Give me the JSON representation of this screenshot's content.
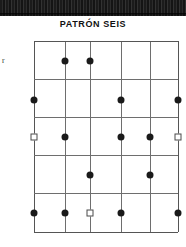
{
  "page": {
    "title": "PATRÓN SEIS",
    "margin_char": "r",
    "scan_band_color": "#1a1a1a",
    "background_color": "#ffffff"
  },
  "chart_data": {
    "type": "scatter",
    "title": "PATRÓN SEIS",
    "xlabel": "",
    "ylabel": "",
    "grid": true,
    "legend": "none",
    "x_gridlines": [
      0,
      1,
      2,
      3,
      4,
      5
    ],
    "y_gridlines": [
      0,
      1,
      2,
      3,
      4,
      5
    ],
    "column_positions_px": [
      34,
      65,
      90,
      121,
      150,
      178
    ],
    "row_positions_px": [
      41,
      79,
      117,
      155,
      193,
      232
    ],
    "marker_styles": {
      "dot": "filled-circle-black",
      "square": "open-square-outline"
    },
    "points": [
      {
        "row": 1,
        "col": 1,
        "marker": "dot",
        "x_px": 65,
        "y_px": 61
      },
      {
        "row": 1,
        "col": 2,
        "marker": "dot",
        "x_px": 90,
        "y_px": 61
      },
      {
        "row": 2,
        "col": 0,
        "marker": "dot",
        "x_px": 34,
        "y_px": 100
      },
      {
        "row": 2,
        "col": 3,
        "marker": "dot",
        "x_px": 121,
        "y_px": 100
      },
      {
        "row": 2,
        "col": 5,
        "marker": "dot",
        "x_px": 178,
        "y_px": 100
      },
      {
        "row": 3,
        "col": 0,
        "marker": "square",
        "x_px": 34,
        "y_px": 137
      },
      {
        "row": 3,
        "col": 1,
        "marker": "dot",
        "x_px": 65,
        "y_px": 137
      },
      {
        "row": 3,
        "col": 3,
        "marker": "dot",
        "x_px": 121,
        "y_px": 137
      },
      {
        "row": 3,
        "col": 4,
        "marker": "dot",
        "x_px": 150,
        "y_px": 137
      },
      {
        "row": 3,
        "col": 5,
        "marker": "square",
        "x_px": 178,
        "y_px": 137
      },
      {
        "row": 4,
        "col": 2,
        "marker": "dot",
        "x_px": 90,
        "y_px": 175
      },
      {
        "row": 4,
        "col": 4,
        "marker": "dot",
        "x_px": 150,
        "y_px": 175
      },
      {
        "row": 5,
        "col": 0,
        "marker": "dot",
        "x_px": 34,
        "y_px": 213
      },
      {
        "row": 5,
        "col": 1,
        "marker": "dot",
        "x_px": 65,
        "y_px": 213
      },
      {
        "row": 5,
        "col": 2,
        "marker": "square",
        "x_px": 90,
        "y_px": 213
      },
      {
        "row": 5,
        "col": 3,
        "marker": "dot",
        "x_px": 121,
        "y_px": 213
      },
      {
        "row": 5,
        "col": 5,
        "marker": "dot",
        "x_px": 178,
        "y_px": 213
      }
    ]
  }
}
